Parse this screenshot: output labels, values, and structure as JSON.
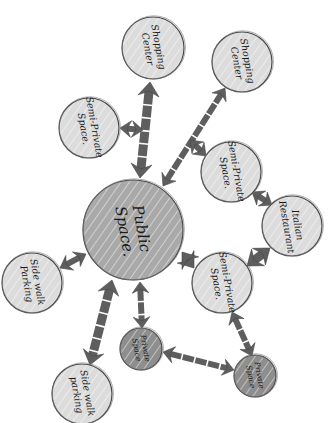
{
  "diagram": {
    "type": "bubble-adjacency-diagram",
    "style": "hand-drawn grayscale marker sketch",
    "colors": {
      "background": "#ffffff",
      "light_node": "#dcdcdc",
      "mid_node": "#a9a9a9",
      "dark_node": "#8e8e8e",
      "connector": "#5e5e5e",
      "text": "#1a1a1a"
    },
    "nodes": [
      {
        "id": "public",
        "line1": "Public",
        "line2": "Space.",
        "cx": 133,
        "cy": 230,
        "r": 50,
        "shade": "mid"
      },
      {
        "id": "shop1",
        "line1": "Shopping",
        "line2": "Center",
        "cx": 153,
        "cy": 48,
        "r": 31,
        "shade": "light"
      },
      {
        "id": "shop2",
        "line1": "Shopping",
        "line2": "Center",
        "cx": 242,
        "cy": 62,
        "r": 30,
        "shade": "light"
      },
      {
        "id": "semi1",
        "line1": "Semi-Private",
        "line2": "Space.",
        "cx": 89,
        "cy": 128,
        "r": 30,
        "shade": "light"
      },
      {
        "id": "semi2",
        "line1": "Semi-Private",
        "line2": "Space.",
        "cx": 231,
        "cy": 172,
        "r": 30,
        "shade": "light"
      },
      {
        "id": "italian",
        "line1": "Italian",
        "line2": "Restaurant",
        "cx": 292,
        "cy": 226,
        "r": 30,
        "shade": "light"
      },
      {
        "id": "semi3",
        "line1": "Semi-Private",
        "line2": "Space.",
        "cx": 222,
        "cy": 283,
        "r": 30,
        "shade": "light"
      },
      {
        "id": "park1",
        "line1": "Side walk",
        "line2": "Parking",
        "cx": 32,
        "cy": 283,
        "r": 30,
        "shade": "light"
      },
      {
        "id": "priv1",
        "line1": "Private",
        "line2": "Space",
        "cx": 141,
        "cy": 349,
        "r": 21,
        "shade": "dark"
      },
      {
        "id": "priv2",
        "line1": "Private",
        "line2": "Space",
        "cx": 255,
        "cy": 376,
        "r": 21,
        "shade": "dark"
      },
      {
        "id": "park2",
        "line1": "Side walk",
        "line2": "parking",
        "cx": 82,
        "cy": 394,
        "r": 30,
        "shade": "light"
      }
    ],
    "connections": [
      {
        "from": "public",
        "to": "shop1",
        "weight": "strong",
        "x1": 140,
        "y1": 178,
        "x2": 150,
        "y2": 82
      },
      {
        "from": "public",
        "to": "shop2",
        "weight": "medium",
        "x1": 163,
        "y1": 186,
        "x2": 225,
        "y2": 88
      },
      {
        "from": "shop1-link",
        "to": "semi1",
        "weight": "medium",
        "x1": 143,
        "y1": 130,
        "x2": 120,
        "y2": 128
      },
      {
        "from": "shop2-link",
        "to": "semi2",
        "weight": "medium",
        "x1": 190,
        "y1": 140,
        "x2": 206,
        "y2": 156
      },
      {
        "from": "semi2",
        "to": "italian",
        "weight": "medium",
        "x1": 252,
        "y1": 192,
        "x2": 272,
        "y2": 205
      },
      {
        "from": "italian",
        "to": "semi3",
        "weight": "strong",
        "x1": 270,
        "y1": 248,
        "x2": 247,
        "y2": 266
      },
      {
        "from": "public",
        "to": "semi3",
        "weight": "strong",
        "x1": 182,
        "y1": 252,
        "x2": 194,
        "y2": 268
      },
      {
        "from": "public",
        "to": "park1",
        "weight": "medium",
        "x1": 86,
        "y1": 254,
        "x2": 60,
        "y2": 268
      },
      {
        "from": "public",
        "to": "park2",
        "weight": "strong",
        "x1": 112,
        "y1": 280,
        "x2": 90,
        "y2": 365
      },
      {
        "from": "public",
        "to": "priv1",
        "weight": "medium",
        "x1": 140,
        "y1": 282,
        "x2": 142,
        "y2": 328
      },
      {
        "from": "semi3",
        "to": "priv2",
        "weight": "medium",
        "x1": 232,
        "y1": 312,
        "x2": 252,
        "y2": 356
      },
      {
        "from": "priv1",
        "to": "priv2",
        "weight": "medium",
        "x1": 163,
        "y1": 352,
        "x2": 234,
        "y2": 370
      }
    ]
  }
}
